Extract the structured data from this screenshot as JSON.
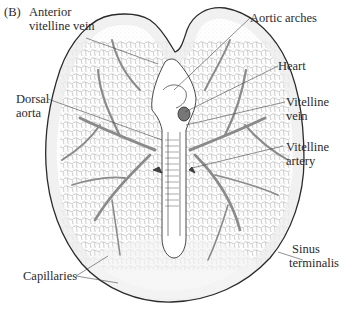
{
  "figure": {
    "panel_label": "(B)"
  },
  "labels": {
    "anterior_vitelline_vein": [
      "Anterior",
      "vitelline vein"
    ],
    "aortic_arches": "Aortic arches",
    "heart": "Heart",
    "dorsal_aorta": [
      "Dorsal",
      "aorta"
    ],
    "vitelline_vein": [
      "Vitelline",
      "vein"
    ],
    "vitelline_artery": [
      "Vitelline",
      "artery"
    ],
    "sinus_terminalis": [
      "Sinus",
      "terminalis"
    ],
    "capillaries": "Capillaries"
  },
  "colors": {
    "outline": "#2b2b2b",
    "vessels": "#8a8a8a",
    "capillary_mesh": "#b5b5b5",
    "stipple": "#d9d9d9",
    "leader_lines": "#444444",
    "text": "#2a2a2a"
  }
}
